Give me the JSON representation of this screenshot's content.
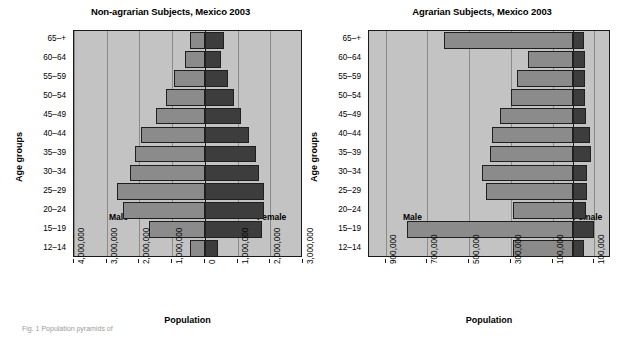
{
  "figure": {
    "caption": "Fig. 1  Population pyramids of"
  },
  "charts": [
    {
      "id": "non-agrarian",
      "title": "Non-agrarian Subjects, Mexico 2003",
      "male_label": "Male",
      "female_label": "Female",
      "ylabel": "Age groups",
      "xlabel": "Population",
      "xticks": [
        "4,000,000",
        "3,000,000",
        "2,000,000",
        "1,000,000",
        "0",
        "1,000,000",
        "2,000,000",
        "3,000,000"
      ],
      "xtick_values": [
        -4000000,
        -3000000,
        -2000000,
        -1000000,
        0,
        1000000,
        2000000,
        3000000
      ],
      "xlim": [
        -4000000,
        3000000
      ],
      "categories": [
        "12–14",
        "15–19",
        "20–24",
        "25–29",
        "30–34",
        "35–39",
        "40–44",
        "45–49",
        "50–54",
        "55–59",
        "60–64",
        "65–+"
      ],
      "male": [
        450000,
        1700000,
        2500000,
        2700000,
        2300000,
        2150000,
        1950000,
        1500000,
        1200000,
        950000,
        600000,
        450000
      ],
      "female": [
        400000,
        1750000,
        1800000,
        1800000,
        1650000,
        1550000,
        1350000,
        1100000,
        900000,
        700000,
        500000,
        600000
      ]
    },
    {
      "id": "agrarian",
      "title": "Agrarian Subjects, Mexico 2003",
      "male_label": "Male",
      "female_label": "Female",
      "ylabel": "Age groups",
      "xlabel": "Population",
      "xticks": [
        "900,000",
        "700,000",
        "500,000",
        "300,000",
        "100,000",
        "100,000"
      ],
      "xtick_values": [
        -900000,
        -700000,
        -500000,
        -300000,
        -100000,
        100000
      ],
      "xlim": [
        -980000,
        180000
      ],
      "categories": [
        "12–14",
        "15–19",
        "20–24",
        "25–29",
        "30–34",
        "35–39",
        "40–44",
        "45–49",
        "50–54",
        "55–59",
        "60–64",
        "65–+"
      ],
      "male": [
        290000,
        800000,
        290000,
        420000,
        440000,
        400000,
        390000,
        350000,
        300000,
        270000,
        220000,
        620000
      ],
      "female": [
        50000,
        100000,
        60000,
        65000,
        65000,
        85000,
        80000,
        60000,
        55000,
        55000,
        55000,
        50000
      ]
    }
  ],
  "chart_data": {
    "type": "bar",
    "subtype": "population-pyramid",
    "grid": true,
    "legend_position": "in-plot",
    "panels": [
      {
        "title": "Non-agrarian Subjects, Mexico 2003",
        "xlabel": "Population",
        "ylabel": "Age groups",
        "xlim": [
          -4000000,
          3000000
        ],
        "xticks": [
          -4000000,
          -3000000,
          -2000000,
          -1000000,
          0,
          1000000,
          2000000,
          3000000
        ],
        "xticklabels": [
          "4,000,000",
          "3,000,000",
          "2,000,000",
          "1,000,000",
          "0",
          "1,000,000",
          "2,000,000",
          "3,000,000"
        ],
        "categories": [
          "12–14",
          "15–19",
          "20–24",
          "25–29",
          "30–34",
          "35–39",
          "40–44",
          "45–49",
          "50–54",
          "55–59",
          "60–64",
          "65–+"
        ],
        "series": [
          {
            "name": "Male",
            "values": [
              450000,
              1700000,
              2500000,
              2700000,
              2300000,
              2150000,
              1950000,
              1500000,
              1200000,
              950000,
              600000,
              450000
            ],
            "direction": "left",
            "color": "#8b8b8b"
          },
          {
            "name": "Female",
            "values": [
              400000,
              1750000,
              1800000,
              1800000,
              1650000,
              1550000,
              1350000,
              1100000,
              900000,
              700000,
              500000,
              600000
            ],
            "direction": "right",
            "color": "#3d3d3d"
          }
        ]
      },
      {
        "title": "Agrarian Subjects, Mexico 2003",
        "xlabel": "Population",
        "ylabel": "Age groups",
        "xlim": [
          -980000,
          180000
        ],
        "xticks": [
          -900000,
          -700000,
          -500000,
          -300000,
          -100000,
          100000
        ],
        "xticklabels": [
          "900,000",
          "700,000",
          "500,000",
          "300,000",
          "100,000",
          "100,000"
        ],
        "categories": [
          "12–14",
          "15–19",
          "20–24",
          "25–29",
          "30–34",
          "35–39",
          "40–44",
          "45–49",
          "50–54",
          "55–59",
          "60–64",
          "65–+"
        ],
        "series": [
          {
            "name": "Male",
            "values": [
              290000,
              800000,
              290000,
              420000,
              440000,
              400000,
              390000,
              350000,
              300000,
              270000,
              220000,
              620000
            ],
            "direction": "left",
            "color": "#8b8b8b"
          },
          {
            "name": "Female",
            "values": [
              50000,
              100000,
              60000,
              65000,
              65000,
              85000,
              80000,
              60000,
              55000,
              55000,
              55000,
              50000
            ],
            "direction": "right",
            "color": "#3d3d3d"
          }
        ]
      }
    ]
  }
}
